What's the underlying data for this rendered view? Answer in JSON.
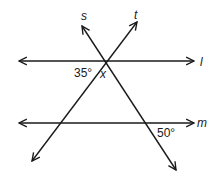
{
  "diagram": {
    "type": "geometry-parallel-lines-transversals",
    "lines": {
      "l": {
        "label": "l",
        "kind": "parallel"
      },
      "m": {
        "label": "m",
        "kind": "parallel"
      },
      "s": {
        "label": "s",
        "kind": "transversal"
      },
      "t": {
        "label": "t",
        "kind": "transversal"
      }
    },
    "angles": {
      "angle_35": "35°",
      "angle_x": "x",
      "angle_50": "50°"
    },
    "colors": {
      "stroke": "#1a1a1a",
      "background": "#ffffff"
    }
  }
}
